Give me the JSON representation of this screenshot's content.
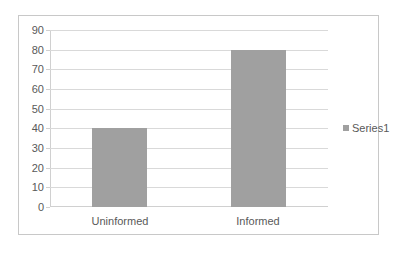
{
  "chart_data": {
    "type": "bar",
    "title": "",
    "xlabel": "",
    "ylabel": "",
    "categories": [
      "Uninformed",
      "Informed"
    ],
    "series": [
      {
        "name": "Series1",
        "values": [
          40,
          80
        ],
        "color": "#a0a0a0"
      }
    ],
    "values": [
      40,
      80
    ],
    "ylim": [
      0,
      90
    ],
    "yticks": [
      0,
      10,
      20,
      30,
      40,
      50,
      60,
      70,
      80,
      90
    ],
    "grid": true,
    "legend_position": "right"
  },
  "axis": {
    "y_ticks": [
      "0",
      "10",
      "20",
      "30",
      "40",
      "50",
      "60",
      "70",
      "80",
      "90"
    ]
  },
  "legend": {
    "label": "Series1"
  }
}
